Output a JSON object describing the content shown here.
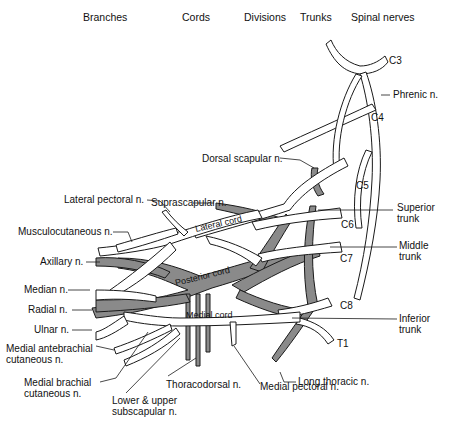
{
  "headers": {
    "branches": "Branches",
    "cords": "Cords",
    "divisions": "Divisions",
    "trunks": "Trunks",
    "spinal_nerves": "Spinal nerves"
  },
  "spinal_nerves": {
    "c3": "C3",
    "c4": "C4",
    "c5": "C5",
    "c6": "C6",
    "c7": "C7",
    "c8": "C8",
    "t1": "T1"
  },
  "trunks": {
    "superior": "Superior\ntrunk",
    "middle": "Middle\ntrunk",
    "inferior": "Inferior\ntrunk"
  },
  "cords": {
    "lateral": "Lateral cord",
    "posterior": "Posterior cord",
    "medial": "Medial cord"
  },
  "branches": {
    "phrenic": "Phrenic n.",
    "dorsal_scapular": "Dorsal scapular n.",
    "suprascapular": "Suprascapular n.",
    "lateral_pectoral": "Lateral pectoral n.",
    "musculocutaneous": "Musculocutaneous n.",
    "axillary": "Axillary n.",
    "median": "Median n.",
    "radial": "Radial n.",
    "ulnar": "Ulnar n.",
    "medial_antebrachial": "Medial antebrachial\ncutaneous n.",
    "medial_brachial": "Medial brachial\ncutaneous n.",
    "subscapular": "Lower & upper\nsubscapular n.",
    "thoracodorsal": "Thoracodorsal n.",
    "medial_pectoral": "Medial pectoral n.",
    "long_thoracic": "Long thoracic n."
  },
  "colors": {
    "anterior_fill": "#ffffff",
    "posterior_fill": "#8a8a8a",
    "outline": "#1a1a1a"
  }
}
